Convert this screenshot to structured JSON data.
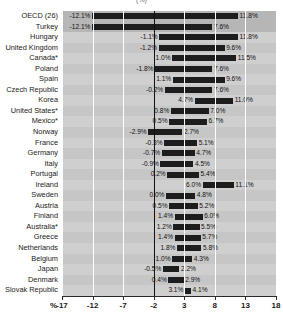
{
  "chart_data": {
    "type": "bar",
    "title": "(%)",
    "xlabel": "%",
    "ylabel": "",
    "xlim": [
      -17,
      18
    ],
    "xticks": [
      -17,
      -12,
      -7,
      -2,
      3,
      8,
      13,
      18
    ],
    "xticklabels": [
      "-17",
      "-12",
      "-7",
      "-2",
      "3",
      "8",
      "13",
      "18"
    ],
    "grid": true,
    "legend": "none",
    "categories": [
      "OECD (26)",
      "Turkey",
      "Hungary",
      "United Kingdom",
      "Canada*",
      "Poland",
      "Spain",
      "Czech Republic",
      "Korea",
      "United States*",
      "Mexico*",
      "Norway",
      "France",
      "Germany",
      "Italy",
      "Portugal",
      "Ireland",
      "Sweden",
      "Austria",
      "Finland",
      "Australia*",
      "Greece",
      "Netherlands",
      "Belgium",
      "Japan",
      "Denmark",
      "Slovak Republic"
    ],
    "series": [
      {
        "name": "range-low",
        "values": [
          -12.1,
          -12.1,
          -1.1,
          -1.2,
          1.0,
          -1.8,
          1.1,
          -0.2,
          4.7,
          0.8,
          0.5,
          -2.9,
          -0.3,
          -0.7,
          -0.9,
          0.2,
          6.0,
          0.0,
          0.5,
          1.4,
          1.2,
          1.4,
          1.8,
          1.0,
          -0.5,
          0.4,
          3.1
        ]
      },
      {
        "name": "range-high",
        "values": [
          11.8,
          7.6,
          11.8,
          9.6,
          11.5,
          7.6,
          9.6,
          7.6,
          11.0,
          7.0,
          6.7,
          2.7,
          5.1,
          4.7,
          4.5,
          5.4,
          11.1,
          4.8,
          5.2,
          6.0,
          5.5,
          5.7,
          5.8,
          4.3,
          2.2,
          2.9,
          4.1
        ]
      }
    ],
    "low_labels": [
      "-12.1%",
      "-12.1%",
      "-1.1%",
      "-1.2%",
      "1.0%",
      "-1.8%",
      "1.1%",
      "-0.2%",
      "4.7%",
      "0.8%",
      "0.5%",
      "-2.9%",
      "-0.3%",
      "-0.7%",
      "-0.9%",
      "0.2%",
      "6.0%",
      "0.0%",
      "0.5%",
      "1.4%",
      "1.2%",
      "1.4%",
      "1.8%",
      "1.0%",
      "-0.5%",
      "0.4%",
      "3.1%"
    ],
    "high_labels": [
      "11.8%",
      "7.6%",
      "11.8%",
      "9.6%",
      "11.5%",
      "7.6%",
      "9.6%",
      "7.6%",
      "11.0%",
      "7.0%",
      "6.7%",
      "2.7%",
      "5.1%",
      "4.7%",
      "4.5%",
      "5.4%",
      "11.1%",
      "4.8%",
      "5.2%",
      "6.0%",
      "5.5%",
      "5.7%",
      "5.8%",
      "4.3%",
      "2.2%",
      "2.9%",
      "4.1%"
    ],
    "highlight_rows": [
      0,
      1
    ]
  }
}
